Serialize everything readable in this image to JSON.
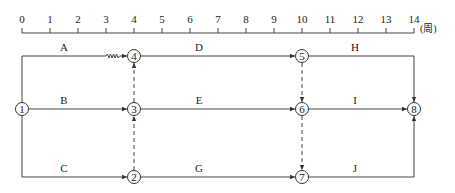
{
  "timescale": {
    "ticks": [
      "0",
      "1",
      "2",
      "3",
      "4",
      "5",
      "6",
      "7",
      "8",
      "9",
      "10",
      "11",
      "12",
      "13",
      "14"
    ],
    "unit": "(周)"
  },
  "nodes": [
    {
      "id": "1",
      "label": "1"
    },
    {
      "id": "2",
      "label": "2"
    },
    {
      "id": "3",
      "label": "3"
    },
    {
      "id": "4",
      "label": "4"
    },
    {
      "id": "5",
      "label": "5"
    },
    {
      "id": "6",
      "label": "6"
    },
    {
      "id": "7",
      "label": "7"
    },
    {
      "id": "8",
      "label": "8"
    }
  ],
  "activities": [
    {
      "name": "A",
      "from": "1",
      "to": "4",
      "duration": 3,
      "free_float": 1
    },
    {
      "name": "B",
      "from": "1",
      "to": "3",
      "duration": 4
    },
    {
      "name": "C",
      "from": "1",
      "to": "2",
      "duration": 4
    },
    {
      "name": "D",
      "from": "4",
      "to": "5",
      "duration": 6
    },
    {
      "name": "E",
      "from": "3",
      "to": "6",
      "duration": 6
    },
    {
      "name": "G",
      "from": "2",
      "to": "7",
      "duration": 6
    },
    {
      "name": "H",
      "from": "5",
      "to": "8",
      "duration": 4
    },
    {
      "name": "I",
      "from": "6",
      "to": "8",
      "duration": 4
    },
    {
      "name": "J",
      "from": "7",
      "to": "8",
      "duration": 4
    }
  ],
  "dummies": [
    {
      "from": "3",
      "to": "4"
    },
    {
      "from": "2",
      "to": "3"
    },
    {
      "from": "5",
      "to": "6"
    },
    {
      "from": "6",
      "to": "7"
    }
  ]
}
